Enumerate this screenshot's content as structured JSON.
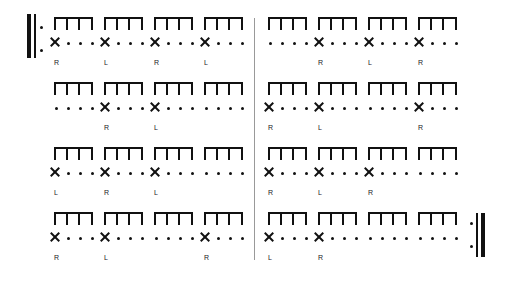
{
  "sheet": {
    "type": "rhythm-sticking-exercise",
    "repeat_start": true,
    "repeat_end": true,
    "rows": [
      {
        "left": [
          {
            "slots": [
              "x",
              "dot",
              "dot",
              "dot"
            ],
            "label": "R"
          },
          {
            "slots": [
              "x",
              "dot",
              "dot",
              "dot"
            ],
            "label": "L"
          },
          {
            "slots": [
              "x",
              "dot",
              "dot",
              "dot"
            ],
            "label": "R"
          },
          {
            "slots": [
              "x",
              "dot",
              "dot",
              "dot"
            ],
            "label": "L"
          }
        ],
        "right": [
          {
            "slots": [
              "dot",
              "dot",
              "dot",
              "dot"
            ],
            "label": ""
          },
          {
            "slots": [
              "x",
              "dot",
              "dot",
              "dot"
            ],
            "label": "R"
          },
          {
            "slots": [
              "x",
              "dot",
              "dot",
              "dot"
            ],
            "label": "L"
          },
          {
            "slots": [
              "x",
              "dot",
              "dot",
              "dot"
            ],
            "label": "R"
          }
        ]
      },
      {
        "left": [
          {
            "slots": [
              "dot",
              "dot",
              "dot",
              "dot"
            ],
            "label": ""
          },
          {
            "slots": [
              "x",
              "dot",
              "dot",
              "dot"
            ],
            "label": "R"
          },
          {
            "slots": [
              "x",
              "dot",
              "dot",
              "dot"
            ],
            "label": "L"
          },
          {
            "slots": [
              "dot",
              "dot",
              "dot",
              "dot"
            ],
            "label": ""
          }
        ],
        "right": [
          {
            "slots": [
              "x",
              "dot",
              "dot",
              "dot"
            ],
            "label": "R"
          },
          {
            "slots": [
              "x",
              "dot",
              "dot",
              "dot"
            ],
            "label": "L"
          },
          {
            "slots": [
              "dot",
              "dot",
              "dot",
              "dot"
            ],
            "label": ""
          },
          {
            "slots": [
              "x",
              "dot",
              "dot",
              "dot"
            ],
            "label": "R"
          }
        ]
      },
      {
        "left": [
          {
            "slots": [
              "x",
              "dot",
              "dot",
              "dot"
            ],
            "label": "L"
          },
          {
            "slots": [
              "x",
              "dot",
              "dot",
              "dot"
            ],
            "label": "R"
          },
          {
            "slots": [
              "x",
              "dot",
              "dot",
              "dot"
            ],
            "label": "L"
          },
          {
            "slots": [
              "dot",
              "dot",
              "dot",
              "dot"
            ],
            "label": ""
          }
        ],
        "right": [
          {
            "slots": [
              "x",
              "dot",
              "dot",
              "dot"
            ],
            "label": "R"
          },
          {
            "slots": [
              "x",
              "dot",
              "dot",
              "dot"
            ],
            "label": "L"
          },
          {
            "slots": [
              "x",
              "dot",
              "dot",
              "dot"
            ],
            "label": "R"
          },
          {
            "slots": [
              "dot",
              "dot",
              "dot",
              "dot"
            ],
            "label": ""
          }
        ]
      },
      {
        "left": [
          {
            "slots": [
              "x",
              "dot",
              "dot",
              "dot"
            ],
            "label": "R"
          },
          {
            "slots": [
              "x",
              "dot",
              "dot",
              "dot"
            ],
            "label": "L"
          },
          {
            "slots": [
              "dot",
              "dot",
              "dot",
              "dot"
            ],
            "label": ""
          },
          {
            "slots": [
              "x",
              "dot",
              "dot",
              "dot"
            ],
            "label": "R"
          }
        ],
        "right": [
          {
            "slots": [
              "x",
              "dot",
              "dot",
              "dot"
            ],
            "label": "L"
          },
          {
            "slots": [
              "x",
              "dot",
              "dot",
              "dot"
            ],
            "label": "R"
          },
          {
            "slots": [
              "dot",
              "dot",
              "dot",
              "dot"
            ],
            "label": ""
          },
          {
            "slots": [
              "dot",
              "dot",
              "dot",
              "dot"
            ],
            "label": ""
          }
        ]
      }
    ]
  }
}
